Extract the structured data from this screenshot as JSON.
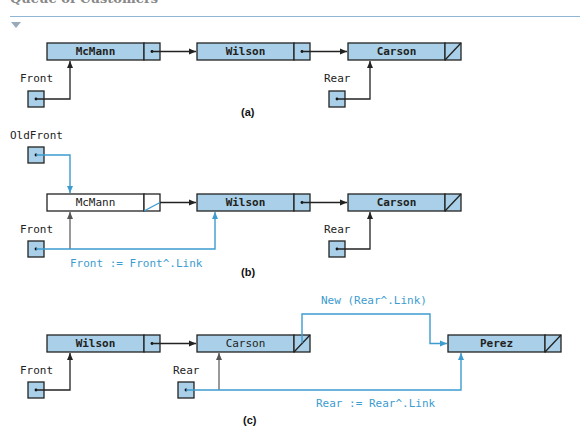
{
  "header": {
    "title": "Queue of Customers"
  },
  "panels": {
    "a": {
      "caption": "(a)",
      "nodes": [
        "McMann",
        "Wilson",
        "Carson"
      ],
      "pointers": {
        "front": "Front",
        "rear": "Rear"
      }
    },
    "b": {
      "caption": "(b)",
      "nodes": [
        "McMann",
        "Wilson",
        "Carson"
      ],
      "pointers": {
        "old_front": "OldFront",
        "front": "Front",
        "rear": "Rear"
      },
      "operation": "Front := Front^.Link"
    },
    "c": {
      "caption": "(c)",
      "nodes": [
        "Wilson",
        "Carson",
        "Perez"
      ],
      "pointers": {
        "front": "Front",
        "rear": "Rear"
      },
      "operation_new": "New (Rear^.Link)",
      "operation_rear": "Rear := Rear^.Link"
    }
  },
  "colors": {
    "node_fill": "#a9d0e8",
    "accent": "#3d9ccf",
    "line": "#222222"
  }
}
